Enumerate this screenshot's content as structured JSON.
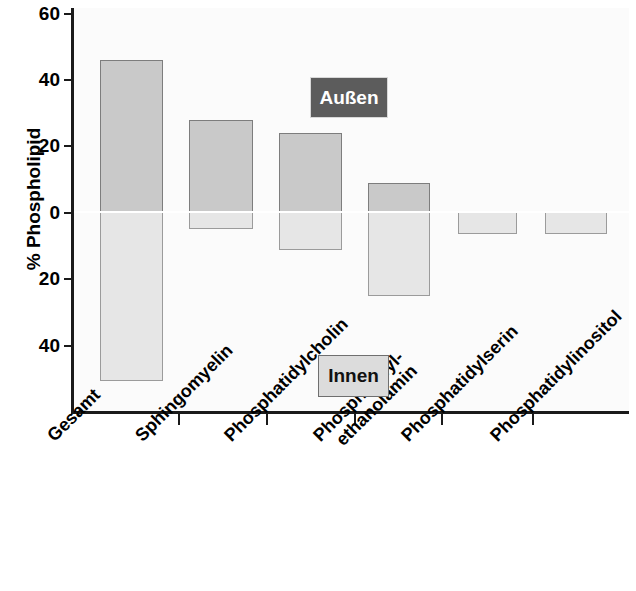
{
  "chart_data": {
    "type": "bar",
    "title": "",
    "xlabel": "",
    "ylabel": "% Phospholipid",
    "ylim": [
      -60,
      60
    ],
    "ytick_labels": [
      "60",
      "40",
      "20",
      "0",
      "20",
      "40"
    ],
    "ytick_values": [
      60,
      40,
      20,
      0,
      -20,
      -40
    ],
    "grid": false,
    "legend_position": "inside",
    "categories": [
      "Gesamt",
      "Sphingomyelin",
      "Phosphatidylcholin",
      "Phosphatidyl-\nethanolamin",
      "Phosphatidylserin",
      "Phosphatidylinositol"
    ],
    "category_lines": [
      [
        "Gesamt"
      ],
      [
        "Sphingomyelin"
      ],
      [
        "Phosphatidylcholin"
      ],
      [
        "Phosphatidyl-",
        "ethanolamin"
      ],
      [
        "Phosphatidylserin"
      ],
      [
        "Phosphatidylinositol"
      ]
    ],
    "series": [
      {
        "name": "Außen",
        "values": [
          46,
          28,
          24,
          9,
          0,
          0
        ],
        "color": "#c9c9c9"
      },
      {
        "name": "Innen",
        "values": [
          -51,
          -4.5,
          -11,
          -25,
          -5,
          -5
        ],
        "color": "#e6e6e6"
      }
    ],
    "annotations": [
      {
        "text": "Außen",
        "style": "dark-chip"
      },
      {
        "text": "Innen",
        "style": "light-chip"
      }
    ]
  },
  "legend": {
    "outer_label": "Außen",
    "inner_label": "Innen"
  },
  "axis": {
    "y_title": "% Phospholipid"
  }
}
